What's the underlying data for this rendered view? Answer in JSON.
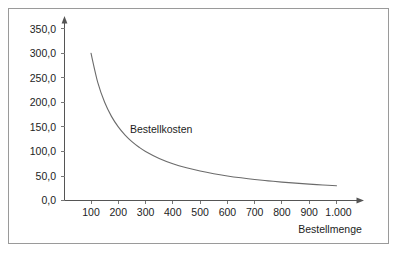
{
  "chart_data": {
    "type": "line",
    "title": "",
    "xlabel": "Bestellmenge",
    "ylabel": "",
    "series_label": "Bestellkosten",
    "x": [
      100,
      125,
      150,
      175,
      200,
      225,
      250,
      275,
      300,
      350,
      400,
      450,
      500,
      550,
      600,
      650,
      700,
      750,
      800,
      850,
      900,
      950,
      1000
    ],
    "values": [
      300.0,
      240.0,
      200.0,
      171.4,
      150.0,
      133.3,
      120.0,
      109.1,
      100.0,
      85.7,
      75.0,
      66.7,
      60.0,
      54.5,
      50.0,
      46.2,
      42.9,
      40.0,
      37.5,
      35.3,
      33.3,
      31.6,
      30.0
    ],
    "series": [
      {
        "name": "Bestellkosten",
        "values": [
          300.0,
          240.0,
          200.0,
          171.4,
          150.0,
          133.3,
          120.0,
          109.1,
          100.0,
          85.7,
          75.0,
          66.7,
          60.0,
          54.5,
          50.0,
          46.2,
          42.9,
          40.0,
          37.5,
          35.3,
          33.3,
          31.6,
          30.0
        ]
      }
    ],
    "xlim": [
      0,
      1075
    ],
    "ylim": [
      0,
      350
    ],
    "x_ticks": [
      100,
      200,
      300,
      400,
      500,
      600,
      700,
      800,
      900,
      1000
    ],
    "x_tick_labels": [
      "100",
      "200",
      "300",
      "400",
      "500",
      "600",
      "700",
      "800",
      "900",
      "1.000"
    ],
    "y_ticks": [
      0,
      50,
      100,
      150,
      200,
      250,
      300,
      350
    ],
    "y_tick_labels": [
      "0,0",
      "50,0",
      "100,0",
      "150,0",
      "200,0",
      "250,0",
      "300,0",
      "350,0"
    ],
    "grid": false,
    "legend": "none",
    "annotations": [
      {
        "text": "Bestellkosten",
        "x": 300,
        "y": 130
      }
    ],
    "colors": {
      "curve": "#6b6b6b",
      "axis": "#555555",
      "text": "#1d1d1d",
      "frame": "#9a9a9a",
      "background": "#ffffff"
    }
  },
  "axis_titles": {
    "x": "Bestellmenge"
  },
  "y_labels": {
    "t0": "0,0",
    "t1": "50,0",
    "t2": "100,0",
    "t3": "150,0",
    "t4": "200,0",
    "t5": "250,0",
    "t6": "300,0",
    "t7": "350,0"
  },
  "x_labels": {
    "t0": "100",
    "t1": "200",
    "t2": "300",
    "t3": "400",
    "t4": "500",
    "t5": "600",
    "t6": "700",
    "t7": "800",
    "t8": "900",
    "t9": "1.000"
  },
  "curve_label": "Bestellkosten"
}
